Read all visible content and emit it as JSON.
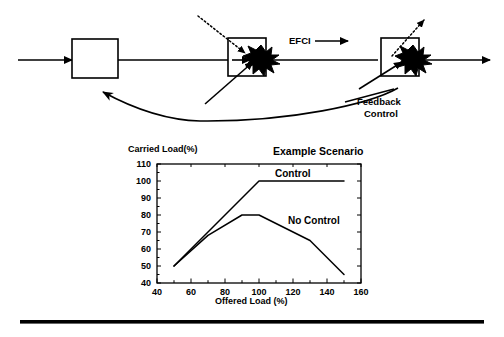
{
  "figure": {
    "diagram": {
      "labels": {
        "efci": "EFCI",
        "feedback_line1": "Feedback",
        "feedback_line2": "Control"
      },
      "nodes": [
        {
          "name": "source-switch",
          "label": ""
        },
        {
          "name": "congested-switch-1",
          "label": ""
        },
        {
          "name": "congested-switch-2",
          "label": ""
        }
      ]
    },
    "chart_data": {
      "type": "line",
      "title": "Example Scenario",
      "xlabel": "Offered Load (%)",
      "ylabel": "Carried Load(%)",
      "xlim": [
        40,
        160
      ],
      "ylim": [
        40,
        110
      ],
      "xticks": [
        40,
        60,
        80,
        100,
        120,
        140,
        160
      ],
      "yticks": [
        40,
        50,
        60,
        70,
        80,
        90,
        100,
        110
      ],
      "xtick_labels": [
        "40",
        "60",
        "80",
        "100",
        "120",
        "140",
        "160"
      ],
      "ytick_labels": [
        "40",
        "50",
        "60",
        "70",
        "80",
        "90",
        "100",
        "110"
      ],
      "grid": false,
      "legend": "inline-annotations",
      "series": [
        {
          "name": "Control",
          "label": "Control",
          "x": [
            50,
            100,
            150
          ],
          "values": [
            50,
            100,
            100
          ]
        },
        {
          "name": "No Control",
          "label": "No Control",
          "x": [
            50,
            70,
            90,
            100,
            130,
            150
          ],
          "values": [
            50,
            68,
            80,
            80,
            65,
            45
          ]
        }
      ]
    }
  },
  "colors": {
    "ink": "#000000",
    "paper": "#ffffff"
  }
}
